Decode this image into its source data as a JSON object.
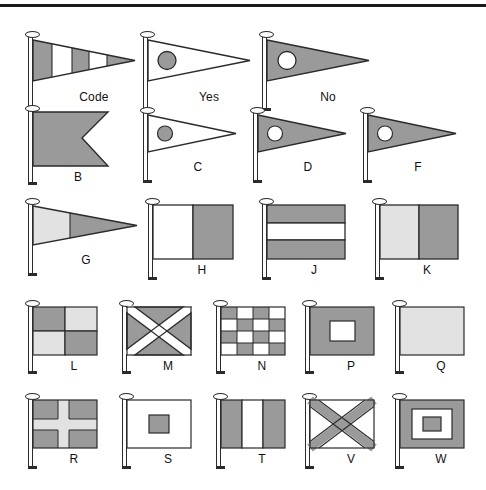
{
  "page": {
    "width": 486,
    "height": 490,
    "background": "#ffffff",
    "rule_color": "#1a1a1a"
  },
  "palette": {
    "dark": "#9a9a9a",
    "dark_stipple": "#8f8f8f",
    "light": "#dcdcdc",
    "light_stipple": "#e2e2e2",
    "white": "#ffffff",
    "outline": "#2b2b2b",
    "pole": "#fdfdfd",
    "label": "#111111"
  },
  "rows": [
    {
      "row": 1,
      "flags": [
        {
          "label": "Code",
          "shape": "pennant",
          "pattern": "vertical-stripes-5",
          "colors": [
            "dark",
            "white",
            "dark",
            "white",
            "dark"
          ]
        },
        {
          "label": "Yes",
          "shape": "pennant",
          "pattern": "white-with-dark-disc",
          "colors": [
            "white",
            "dark"
          ]
        },
        {
          "label": "No",
          "shape": "pennant",
          "pattern": "dark-with-white-disc",
          "colors": [
            "dark",
            "white"
          ]
        }
      ]
    },
    {
      "row": 2,
      "flags": [
        {
          "label": "B",
          "shape": "swallowtail",
          "pattern": "solid",
          "colors": [
            "dark"
          ]
        },
        {
          "label": "C",
          "shape": "pennant",
          "pattern": "white-with-dark-disc",
          "colors": [
            "white",
            "dark"
          ]
        },
        {
          "label": "D",
          "shape": "pennant",
          "pattern": "dark-with-white-disc",
          "colors": [
            "dark",
            "white"
          ]
        },
        {
          "label": "F",
          "shape": "pennant",
          "pattern": "dark-with-white-disc",
          "colors": [
            "dark",
            "white"
          ]
        }
      ]
    },
    {
      "row": 3,
      "flags": [
        {
          "label": "G",
          "shape": "pennant",
          "pattern": "vertical-halves",
          "colors": [
            "light",
            "dark"
          ]
        },
        {
          "label": "H",
          "shape": "rectangle",
          "pattern": "vertical-halves",
          "colors": [
            "white",
            "dark"
          ]
        },
        {
          "label": "J",
          "shape": "rectangle",
          "pattern": "horizontal-stripes-3",
          "colors": [
            "dark",
            "white",
            "dark"
          ]
        },
        {
          "label": "K",
          "shape": "rectangle",
          "pattern": "vertical-halves",
          "colors": [
            "light",
            "dark"
          ]
        }
      ]
    },
    {
      "row": 4,
      "flags": [
        {
          "label": "L",
          "shape": "rectangle",
          "pattern": "quartered",
          "colors": [
            "dark",
            "light",
            "light",
            "dark"
          ]
        },
        {
          "label": "M",
          "shape": "rectangle",
          "pattern": "saltire",
          "colors": [
            "dark",
            "white"
          ]
        },
        {
          "label": "N",
          "shape": "rectangle",
          "pattern": "checker-4x4",
          "colors": [
            "dark",
            "white"
          ]
        },
        {
          "label": "P",
          "shape": "rectangle",
          "pattern": "dark-with-white-rect",
          "colors": [
            "dark",
            "white"
          ]
        },
        {
          "label": "Q",
          "shape": "rectangle",
          "pattern": "solid",
          "colors": [
            "light"
          ]
        }
      ]
    },
    {
      "row": 5,
      "flags": [
        {
          "label": "R",
          "shape": "rectangle",
          "pattern": "cross",
          "colors": [
            "dark",
            "light"
          ]
        },
        {
          "label": "S",
          "shape": "rectangle",
          "pattern": "white-with-dark-square",
          "colors": [
            "white",
            "dark"
          ]
        },
        {
          "label": "T",
          "shape": "rectangle",
          "pattern": "vertical-stripes-3",
          "colors": [
            "dark",
            "white",
            "dark"
          ]
        },
        {
          "label": "V",
          "shape": "rectangle",
          "pattern": "saltire",
          "colors": [
            "white",
            "dark"
          ]
        },
        {
          "label": "W",
          "shape": "rectangle",
          "pattern": "concentric-squares",
          "colors": [
            "dark",
            "white",
            "dark"
          ]
        }
      ]
    }
  ]
}
